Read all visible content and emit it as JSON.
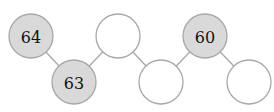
{
  "diagram": {
    "type": "number-chain",
    "nodes": [
      {
        "id": "n1",
        "value": "64",
        "filled": true,
        "cx": 31,
        "cy": 36
      },
      {
        "id": "n2",
        "value": "63",
        "filled": true,
        "cx": 74,
        "cy": 82
      },
      {
        "id": "n3",
        "value": "",
        "filled": false,
        "cx": 118,
        "cy": 36
      },
      {
        "id": "n4",
        "value": "",
        "filled": false,
        "cx": 161,
        "cy": 82
      },
      {
        "id": "n5",
        "value": "60",
        "filled": true,
        "cx": 205,
        "cy": 36
      },
      {
        "id": "n6",
        "value": "",
        "filled": false,
        "cx": 249,
        "cy": 82
      }
    ],
    "colors": {
      "filled": "#d9d9d9",
      "empty": "#ffffff",
      "stroke": "#a8a8a8"
    }
  }
}
